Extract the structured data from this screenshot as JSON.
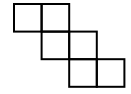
{
  "diagram": {
    "type": "square-net",
    "stroke_color": "#000000",
    "background_color": "#ffffff",
    "cell_size": 27.6,
    "origin": [
      14,
      4
    ],
    "cells": [
      {
        "row": 0,
        "col": 0
      },
      {
        "row": 0,
        "col": 1
      },
      {
        "row": 1,
        "col": 1
      },
      {
        "row": 1,
        "col": 2
      },
      {
        "row": 2,
        "col": 2
      },
      {
        "row": 2,
        "col": 3
      }
    ]
  }
}
